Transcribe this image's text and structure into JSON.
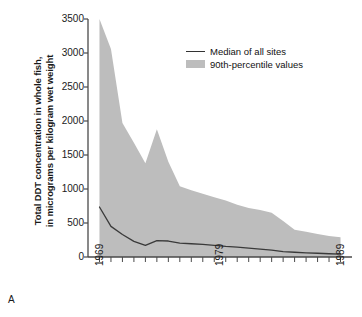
{
  "panel": {
    "letter": "A"
  },
  "chart_data": {
    "type": "area",
    "title": "",
    "subtitle": "",
    "xlabel": "",
    "ylabel": "Total DDT concentration in whole fish, in micrograms per kilogram wet weight",
    "ylabel_line1": "Total DDT concentration in whole fish,",
    "ylabel_line2": "in micrograms per kilogram wet weight",
    "xlim": [
      1968,
      1991
    ],
    "ylim": [
      0,
      3500
    ],
    "yticks": [
      0,
      500,
      1000,
      1500,
      2000,
      2500,
      3000,
      3500
    ],
    "ytick_labels": [
      "0",
      "500",
      "1000",
      "1500",
      "2000",
      "2500",
      "3000",
      "3500"
    ],
    "xticks": [
      1969,
      1970,
      1971,
      1972,
      1973,
      1974,
      1975,
      1976,
      1977,
      1978,
      1979,
      1980,
      1981,
      1982,
      1983,
      1984,
      1985,
      1986,
      1987,
      1988,
      1989,
      1990
    ],
    "xtick_labels_shown": [
      "1969",
      "1979",
      "1989"
    ],
    "xtick_labels_positions": [
      1969,
      1979,
      1989
    ],
    "grid": false,
    "legend_position": "upper-right-inside",
    "x": [
      1969,
      1970,
      1971,
      1972,
      1973,
      1974,
      1975,
      1976,
      1977,
      1978,
      1979,
      1980,
      1981,
      1982,
      1983,
      1984,
      1985,
      1986,
      1987,
      1988,
      1989,
      1990
    ],
    "series": [
      {
        "name": "90th-percentile values",
        "type": "area",
        "color": "#bdbdbd",
        "values": [
          3500,
          3060,
          1970,
          1680,
          1380,
          1880,
          1400,
          1040,
          980,
          930,
          880,
          830,
          770,
          720,
          690,
          650,
          530,
          400,
          370,
          340,
          310,
          290
        ]
      },
      {
        "name": "Median of all sites",
        "type": "line",
        "color": "#3a3a3a",
        "values": [
          735,
          450,
          330,
          230,
          170,
          240,
          235,
          205,
          195,
          185,
          170,
          155,
          145,
          130,
          115,
          100,
          80,
          70,
          62,
          55,
          48,
          42
        ]
      }
    ]
  },
  "legend": {
    "items": [
      {
        "label": "Median of all sites",
        "marker": "line",
        "color": "#3a3a3a"
      },
      {
        "label": "90th-percentile values",
        "marker": "swatch",
        "color": "#bdbdbd"
      }
    ]
  },
  "axes": {
    "y_tick_labels": [
      "3500",
      "3000",
      "2500",
      "2000",
      "1500",
      "1000",
      "500",
      "0"
    ],
    "x_tick_labels": [
      "1969",
      "1979",
      "1989"
    ]
  },
  "colors": {
    "area_fill": "#bdbdbd",
    "median_line": "#3a3a3a",
    "axis": "#4a4a4a",
    "text": "#1a1a1a",
    "background": "#ffffff"
  }
}
